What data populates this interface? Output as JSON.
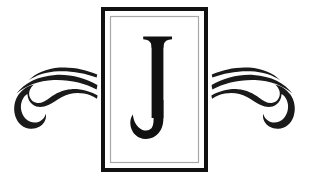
{
  "artwork": {
    "title": "Decorative Monogram J",
    "type": "monogram-emblem",
    "background_color": "#ffffff",
    "canvas": {
      "width": 309,
      "height": 187
    }
  },
  "monogram": {
    "letter": "J",
    "letter_color": "#111111",
    "letter_style": "serif-capital",
    "letter_font_size": 138,
    "letter_center_x": 157,
    "letter_baseline_y": 141
  },
  "frame": {
    "name": "double-line-rectangle",
    "outer": {
      "x": 101,
      "y": 7,
      "width": 107,
      "height": 165,
      "stroke_color": "#111111",
      "stroke_width": 4
    },
    "inner": {
      "x": 110,
      "y": 16,
      "width": 89,
      "height": 147,
      "stroke_color": "#a8a8a8",
      "stroke_width": 1.2
    },
    "fill_color": "#ffffff"
  },
  "ornaments": {
    "stroke_color": "#1a1a1a",
    "left": {
      "name": "flourish-left",
      "mirrored": false,
      "bounds": {
        "x": 13,
        "y": 66,
        "width": 85,
        "height": 63
      },
      "stroke_count": 3,
      "has_spiral_curl": true,
      "curl_position": "lower-left"
    },
    "right": {
      "name": "flourish-right",
      "mirrored": true,
      "bounds": {
        "x": 211,
        "y": 66,
        "width": 85,
        "height": 63
      },
      "stroke_count": 3,
      "has_spiral_curl": true,
      "curl_position": "lower-right"
    }
  }
}
